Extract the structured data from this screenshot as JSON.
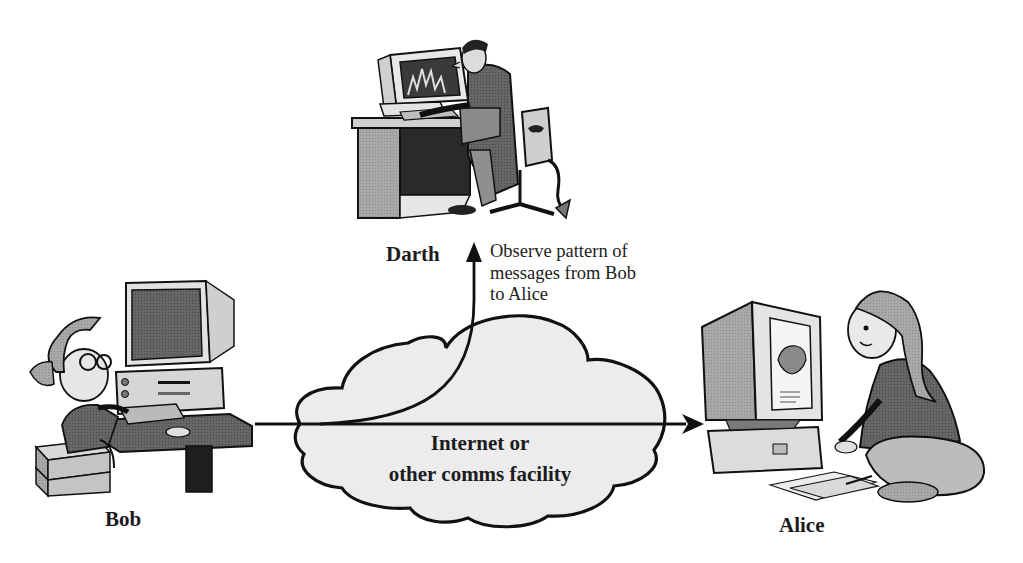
{
  "diagram": {
    "type": "passive-attack-traffic-analysis",
    "actors": {
      "bob": {
        "label": "Bob"
      },
      "alice": {
        "label": "Alice"
      },
      "darth": {
        "label": "Darth"
      }
    },
    "network": {
      "label": "Internet or\nother comms facility"
    },
    "annotation": {
      "text": "Observe pattern of\nmessages from Bob\nto Alice"
    },
    "edges": [
      {
        "from": "Bob",
        "to": "Alice",
        "style": "arrow"
      },
      {
        "from": "Bob",
        "to": "Darth",
        "style": "curved-arrow"
      }
    ],
    "colors": {
      "cloud_fill": "#ececec",
      "line": "#111111",
      "figure_fill": "#9a9a9a",
      "figure_dark": "#5a5a5a",
      "figure_light": "#d6d6d6"
    }
  }
}
